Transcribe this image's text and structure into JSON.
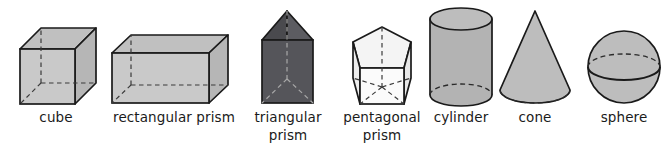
{
  "figure": {
    "kind": "geometric-solids-chart",
    "background_color": "#ffffff",
    "line_color": "#1a1a1a",
    "label_color": "#1b1b1b",
    "hidden_edge_style": "dashed"
  },
  "solids": [
    {
      "id": "cube",
      "label": "cube",
      "label_lines": [
        "cube"
      ],
      "fill_color": "#c9c9c9",
      "top_face_color": "#c0c0c0",
      "side_face_color": "#b9b9b9",
      "label_x": 56,
      "label_y": 122
    },
    {
      "id": "rectangular-prism",
      "label": "rectangular prism",
      "label_lines": [
        "rectangular prism"
      ],
      "fill_color": "#c9c9c9",
      "top_face_color": "#c0c0c0",
      "side_face_color": "#b9b9b9",
      "label_x": 174,
      "label_y": 122
    },
    {
      "id": "triangular-prism",
      "label": "triangular prism",
      "label_lines": [
        "triangular",
        "prism"
      ],
      "fill_color": "#55555a",
      "top_face_color": "#4a4a4e",
      "side_face_color": "#606065",
      "label_x": 288,
      "label_y": 122
    },
    {
      "id": "pentagonal-prism",
      "label": "pentagonal prism",
      "label_lines": [
        "pentagonal",
        "prism"
      ],
      "fill_color": "#fbfbfb",
      "top_face_color": "#f2f2f2",
      "side_face_color": "#ededed",
      "label_x": 382,
      "label_y": 122
    },
    {
      "id": "cylinder",
      "label": "cylinder",
      "label_lines": [
        "cylinder"
      ],
      "fill_color": "#b3b3b3",
      "top_face_color": "#b8b8b8",
      "side_face_color": "#b3b3b3",
      "label_x": 461,
      "label_y": 122
    },
    {
      "id": "cone",
      "label": "cone",
      "label_lines": [
        "cone"
      ],
      "fill_color": "#bdbdbd",
      "top_face_color": "#bdbdbd",
      "side_face_color": "#bdbdbd",
      "label_x": 535,
      "label_y": 122
    },
    {
      "id": "sphere",
      "label": "sphere",
      "label_lines": [
        "sphere"
      ],
      "fill_color": "#bdbdbd",
      "top_face_color": "#bdbdbd",
      "side_face_color": "#bdbdbd",
      "label_x": 624,
      "label_y": 122
    }
  ],
  "labels": {
    "cube": "cube",
    "rectangular_prism": "rectangular prism",
    "triangular_prism_line1": "triangular",
    "triangular_prism_line2": "prism",
    "pentagonal_prism_line1": "pentagonal",
    "pentagonal_prism_line2": "prism",
    "cylinder": "cylinder",
    "cone": "cone",
    "sphere": "sphere"
  }
}
